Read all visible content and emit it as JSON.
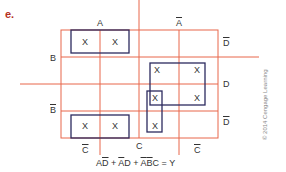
{
  "figure_label": "e.",
  "colors": {
    "grid": "#e8664a",
    "group": "#2c2a5e",
    "label_accent": "#b5311f",
    "text": "#333333"
  },
  "labels": {
    "A": "A",
    "A_bar": "A",
    "B": "B",
    "B_bar": "B",
    "C": "C",
    "C_bar_left": "C",
    "C_bar_right": "C",
    "D": "D",
    "D_bar_top": "D",
    "D_bar_bottom": "D"
  },
  "cells": [
    {
      "row": 0,
      "col": 0,
      "value": "X"
    },
    {
      "row": 0,
      "col": 1,
      "value": "X"
    },
    {
      "row": 1,
      "col": 2,
      "value": "X"
    },
    {
      "row": 1,
      "col": 3,
      "value": "X"
    },
    {
      "row": 2,
      "col": 2,
      "value": "X"
    },
    {
      "row": 2,
      "col": 3,
      "value": "X"
    },
    {
      "row": 3,
      "col": 0,
      "value": "X"
    },
    {
      "row": 3,
      "col": 1,
      "value": "X"
    },
    {
      "row": 3,
      "col": 2,
      "value": "X"
    }
  ],
  "equation": {
    "t1_a": "A",
    "t1_b": "D",
    "plus1": " + ",
    "t2_a": "A",
    "t2_b": "D",
    "plus2": " + ",
    "t3_a": "A",
    "t3_b": "B",
    "t3_c": "C",
    "eq": " = Y"
  },
  "copyright": "© 2014 Cengage Learning"
}
